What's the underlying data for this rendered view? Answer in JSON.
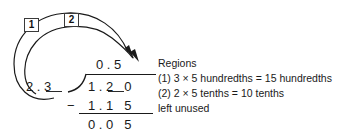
{
  "problem": {
    "type": "long-division",
    "divisor": "2 . 3",
    "dividend": "1 . 2   0",
    "quotient": "0 . 5",
    "subtrahend": "1 . 1   5",
    "remainder": "0 . 0   5",
    "minus_sign": "−",
    "steps": [
      {
        "id": "1",
        "label": "1"
      },
      {
        "id": "2",
        "label": "2"
      }
    ]
  },
  "notes": {
    "heading": "Regions",
    "lines": [
      "(1) 3 × 5 hundredths = 15 hundredths",
      "(2) 2 × 5 tenths = 10 tenths",
      "left unused"
    ]
  },
  "colors": {
    "ink": "#1a1a1a",
    "background": "#ffffff",
    "box_border": "#3a3a3a"
  }
}
